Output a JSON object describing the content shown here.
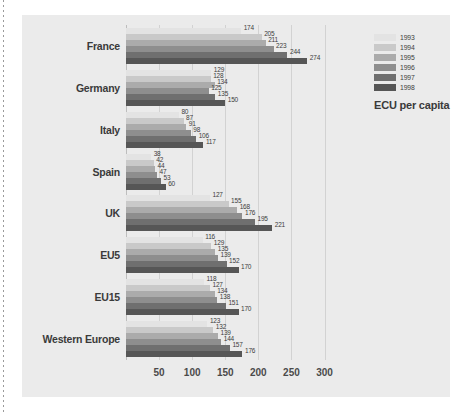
{
  "legend": {
    "title": "ECU per capita",
    "entries": [
      {
        "label": "1993",
        "color": "#e3e3e3"
      },
      {
        "label": "1994",
        "color": "#c9c9c9"
      },
      {
        "label": "1995",
        "color": "#ababab"
      },
      {
        "label": "1996",
        "color": "#8e8e8e"
      },
      {
        "label": "1997",
        "color": "#6f6f6f"
      },
      {
        "label": "1998",
        "color": "#565656"
      }
    ]
  },
  "axis": {
    "ticks": [
      "50",
      "100",
      "150",
      "200",
      "250",
      "300"
    ]
  },
  "chart_data": {
    "type": "bar",
    "orientation": "horizontal",
    "title": "",
    "xlabel": "ECU per capita",
    "ylabel": "",
    "xlim": [
      0,
      340
    ],
    "grid": true,
    "legend_position": "top-right",
    "categories": [
      "France",
      "Germany",
      "Italy",
      "Spain",
      "UK",
      "EU5",
      "EU15",
      "Western Europe"
    ],
    "tick_values": [
      50,
      100,
      150,
      200,
      250,
      300
    ],
    "series": [
      {
        "name": "1993",
        "color": "#e3e3e3",
        "values": [
          174,
          129,
          80,
          38,
          127,
          116,
          118,
          123
        ]
      },
      {
        "name": "1994",
        "color": "#c9c9c9",
        "values": [
          205,
          128,
          87,
          42,
          155,
          129,
          127,
          132
        ]
      },
      {
        "name": "1995",
        "color": "#ababab",
        "values": [
          211,
          134,
          91,
          44,
          168,
          135,
          134,
          139
        ]
      },
      {
        "name": "1996",
        "color": "#8e8e8e",
        "values": [
          223,
          125,
          98,
          47,
          176,
          139,
          138,
          144
        ]
      },
      {
        "name": "1997",
        "color": "#6f6f6f",
        "values": [
          244,
          135,
          106,
          53,
          195,
          152,
          151,
          157
        ]
      },
      {
        "name": "1998",
        "color": "#565656",
        "values": [
          274,
          150,
          117,
          60,
          221,
          170,
          170,
          176
        ]
      }
    ]
  }
}
